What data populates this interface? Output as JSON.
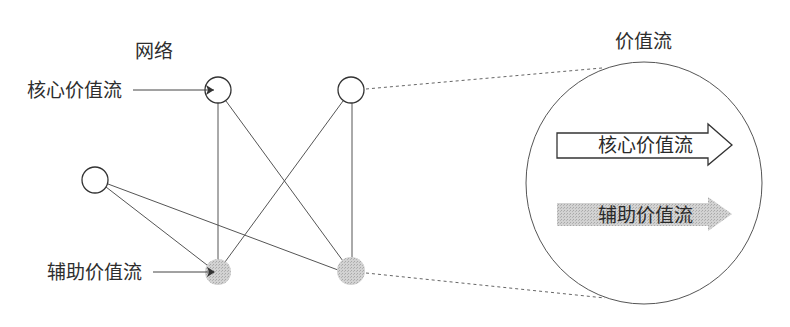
{
  "network": {
    "title": "网络",
    "core_label": "核心价值流",
    "aux_label": "辅助价值流",
    "nodes": [
      {
        "id": "top-left",
        "type": "core",
        "cx": 218,
        "cy": 90,
        "r": 13
      },
      {
        "id": "top-right",
        "type": "core",
        "cx": 351,
        "cy": 90,
        "r": 13
      },
      {
        "id": "left",
        "type": "core",
        "cx": 95,
        "cy": 180,
        "r": 13
      },
      {
        "id": "bottom-left",
        "type": "auxiliary",
        "cx": 218,
        "cy": 272,
        "r": 13
      },
      {
        "id": "bottom-right",
        "type": "auxiliary",
        "cx": 351,
        "cy": 271,
        "r": 13
      }
    ],
    "edges": [
      [
        "top-left",
        "bottom-left"
      ],
      [
        "top-left",
        "bottom-right"
      ],
      [
        "top-right",
        "bottom-left"
      ],
      [
        "top-right",
        "bottom-right"
      ],
      [
        "left",
        "bottom-left"
      ],
      [
        "left",
        "bottom-right"
      ]
    ]
  },
  "value_stream": {
    "title": "价值流",
    "core_arrow_label": "核心价值流",
    "aux_arrow_label": "辅助价值流"
  },
  "colors": {
    "line": "#555555",
    "auxiliary_fill": "#c8c8c8",
    "text": "#2e2e2e"
  }
}
